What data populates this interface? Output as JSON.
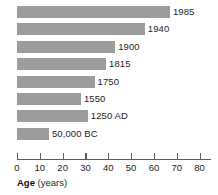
{
  "chart_data": {
    "type": "bar",
    "orientation": "horizontal",
    "title": "",
    "subtitle": "",
    "xlabel": "Age (years)",
    "ylabel": "",
    "xlim": [
      0,
      85
    ],
    "grid": false,
    "legend": null,
    "bar_color": "#9c9c9c",
    "categories": [
      "1985",
      "1940",
      "1900",
      "1815",
      "1750",
      "1550",
      "1250 AD",
      "50,000 BC"
    ],
    "values": [
      67,
      56,
      43,
      39,
      34,
      28,
      31,
      14
    ],
    "data_labels": [
      "1985",
      "1940",
      "1900",
      "1815",
      "1750",
      "1550",
      "1250 AD",
      "50,000 BC"
    ],
    "bars": [
      {
        "label": "1985",
        "value": 67
      },
      {
        "label": "1940",
        "value": 56
      },
      {
        "label": "1900",
        "value": 43
      },
      {
        "label": "1815",
        "value": 39
      },
      {
        "label": "1750",
        "value": 34
      },
      {
        "label": "1550",
        "value": 28
      },
      {
        "label": "1250 AD",
        "value": 31
      },
      {
        "label": "50,000 BC",
        "value": 14
      }
    ],
    "xticks": [
      0,
      10,
      20,
      30,
      40,
      50,
      60,
      70,
      80
    ],
    "xtick_labels": [
      "0",
      "10",
      "20",
      "30",
      "40",
      "50",
      "60",
      "70",
      "80"
    ]
  },
  "axis_title": {
    "main": "Age",
    "unit": "(years)"
  }
}
